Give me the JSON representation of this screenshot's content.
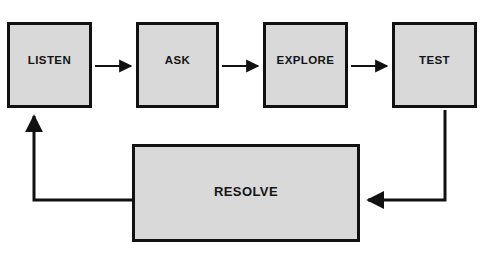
{
  "diagram": {
    "style": {
      "node_fill": "#d9d9d9",
      "node_border": "#111111",
      "text_color": "#141414",
      "connector_color": "#111111",
      "background": "#ffffff"
    },
    "nodes": [
      {
        "id": "listen",
        "label": "LISTEN",
        "x": 7,
        "y": 22,
        "width": 85,
        "height": 86
      },
      {
        "id": "ask",
        "label": "ASK",
        "x": 136,
        "y": 22,
        "width": 83,
        "height": 86
      },
      {
        "id": "explore",
        "label": "EXPLORE",
        "x": 263,
        "y": 22,
        "width": 85,
        "height": 86
      },
      {
        "id": "test",
        "label": "TEST",
        "x": 392,
        "y": 22,
        "width": 85,
        "height": 86
      },
      {
        "id": "resolve",
        "label": "RESOLVE",
        "x": 132,
        "y": 144,
        "width": 228,
        "height": 98
      }
    ],
    "connectors": [
      {
        "id": "listen-to-ask",
        "from": "listen",
        "to": "ask",
        "kind": "straight-right"
      },
      {
        "id": "ask-to-explore",
        "from": "ask",
        "to": "explore",
        "kind": "straight-right"
      },
      {
        "id": "explore-to-test",
        "from": "explore",
        "to": "test",
        "kind": "straight-right"
      },
      {
        "id": "test-to-resolve",
        "from": "test",
        "to": "resolve",
        "kind": "down-then-left"
      },
      {
        "id": "resolve-to-listen",
        "from": "resolve",
        "to": "listen",
        "kind": "left-then-up"
      }
    ]
  }
}
